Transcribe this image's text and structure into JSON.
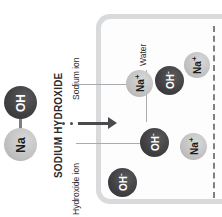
{
  "diagram": {
    "reactant_label": "SODIUM HYDROXIDE",
    "labels": {
      "sodium_ion": "Sodium ion",
      "hydroxide_ion": "Hydroxide ion",
      "water": "Water"
    },
    "molecule": {
      "hydroxide_symbol": "OH",
      "sodium_symbol": "Na"
    },
    "ions": [
      {
        "symbol": "Na+",
        "kind": "sodium",
        "x": 126,
        "y": 70,
        "d": 27
      },
      {
        "symbol": "OH-",
        "kind": "hydroxide",
        "x": 155,
        "y": 66,
        "d": 29
      },
      {
        "symbol": "Na+",
        "kind": "sodium",
        "x": 184,
        "y": 52,
        "d": 26
      },
      {
        "symbol": "OH-",
        "kind": "hydroxide",
        "x": 140,
        "y": 128,
        "d": 29
      },
      {
        "symbol": "Na+",
        "kind": "sodium",
        "x": 180,
        "y": 133,
        "d": 27
      },
      {
        "symbol": "OH-",
        "kind": "hydroxide",
        "x": 108,
        "y": 168,
        "d": 29
      }
    ],
    "colors": {
      "hydroxide_fill": "#404042",
      "sodium_fill": "#c2c2c2",
      "container_stroke": "#d9dadb",
      "arrow": "#4a4a4c",
      "leader": "#a9abad",
      "dashed_edge": "#7e7f81"
    }
  }
}
